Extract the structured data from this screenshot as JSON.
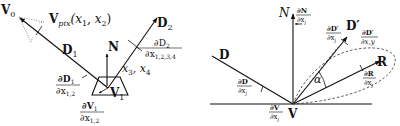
{
  "left_diagram": {
    "labels": {
      "v0": "V",
      "v0_sub": "0",
      "vpix": "V",
      "vpix_sub": "pix",
      "vpix_args": "(x",
      "vpix_x1_sub": "1",
      "vpix_comma": ", x",
      "vpix_x2_sub": "2",
      "vpix_close": ")",
      "d1": "D",
      "d1_sub": "1",
      "d2": "D",
      "d2_sub": "2",
      "n": "N",
      "v1": "V",
      "v1_sub": "1",
      "x34": "x",
      "x34_sub3": "3",
      "x34_mid": ", x",
      "x34_sub4": "4"
    },
    "derivatives": {
      "dD2_num": "∂D",
      "dD2_num_sub": "2",
      "dD2_den": "∂x",
      "dD2_den_sub": "1,2,3,4",
      "dD1_num": "∂D",
      "dD1_num_sub": "1",
      "dD1_den": "∂x",
      "dD1_den_sub": "1,2",
      "dV1_num": "∂V",
      "dV1_num_sub": "1",
      "dV1_den": "∂x",
      "dV1_den_sub": "1,2"
    }
  },
  "right_diagram": {
    "labels": {
      "n": "N",
      "d": "D",
      "d_prime": "D′",
      "r": "R",
      "v": "V",
      "alpha": "α"
    },
    "derivatives": {
      "dN_num": "∂N",
      "dN_den": "∂x",
      "dN_den_sub": "j",
      "dDp_num": "∂D′",
      "dDp_den": "∂x",
      "dDp_den_sub": "j",
      "dDpxy_num": "∂D′",
      "dDpxy_den": "∂x,y",
      "dR_num": "∂R",
      "dR_den": "∂x",
      "dR_den_sub": "j",
      "dD_num": "∂D",
      "dD_den": "∂x",
      "dD_den_sub": "j",
      "dV_num": "∂V",
      "dV_den": "∂x",
      "dV_den_sub": "j"
    }
  }
}
